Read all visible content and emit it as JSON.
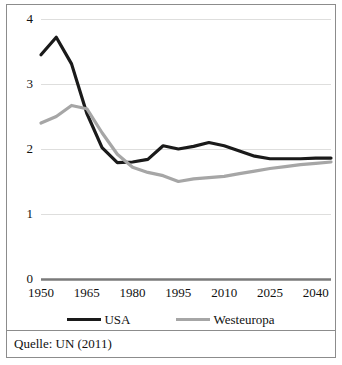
{
  "figure": {
    "source_note": "Quelle: UN (2011)"
  },
  "legend": {
    "position": "bottom-center",
    "items": [
      {
        "label": "USA",
        "color": "#1a1a1a",
        "swatch_name": "usa-line-swatch"
      },
      {
        "label": "Westeuropa",
        "color": "#a6a6a6",
        "swatch_name": "westeuropa-line-swatch"
      }
    ]
  },
  "chart_data": {
    "type": "line",
    "title": "",
    "subtitle": "",
    "xlabel": "",
    "ylabel": "",
    "xlim": [
      1950,
      2045
    ],
    "ylim": [
      0,
      4
    ],
    "grid": true,
    "y_ticks": [
      "0",
      "1",
      "2",
      "3",
      "4"
    ],
    "y_tick_values": [
      0,
      1,
      2,
      3,
      4
    ],
    "x_ticks": [
      "1950",
      "1965",
      "1980",
      "1995",
      "2010",
      "2025",
      "2040"
    ],
    "x_tick_values": [
      1950,
      1965,
      1980,
      1995,
      2010,
      2025,
      2040
    ],
    "x": [
      1950,
      1955,
      1960,
      1965,
      1970,
      1975,
      1980,
      1985,
      1990,
      1995,
      2000,
      2005,
      2010,
      2015,
      2020,
      2025,
      2030,
      2035,
      2040,
      2045
    ],
    "series": [
      {
        "name": "USA",
        "color": "#1a1a1a",
        "values": [
          3.45,
          3.72,
          3.31,
          2.55,
          2.02,
          1.79,
          1.8,
          1.84,
          2.05,
          2.0,
          2.04,
          2.1,
          2.05,
          1.97,
          1.89,
          1.85,
          1.85,
          1.85,
          1.86,
          1.86
        ]
      },
      {
        "name": "Westeuropa",
        "color": "#a6a6a6",
        "values": [
          2.4,
          2.5,
          2.67,
          2.62,
          2.25,
          1.92,
          1.72,
          1.64,
          1.59,
          1.5,
          1.54,
          1.56,
          1.58,
          1.62,
          1.66,
          1.7,
          1.73,
          1.76,
          1.78,
          1.8
        ]
      }
    ],
    "annotations": []
  }
}
